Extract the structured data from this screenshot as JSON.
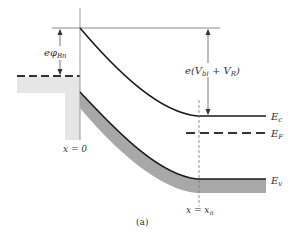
{
  "figure": {
    "caption": "(a)",
    "labels": {
      "barrier_height": "eφ",
      "barrier_height_sub": "Bn",
      "potential": "e(V",
      "potential_sub1": "bi",
      "potential_mid": " + V",
      "potential_sub2": "R",
      "potential_end": ")",
      "ec": "E",
      "ec_sub": "c",
      "ef": "E",
      "ef_sub": "F",
      "ev": "E",
      "ev_sub": "v",
      "x0": "x = 0",
      "xn": "x = x",
      "xn_sub": "n"
    },
    "colors": {
      "line": "#1a1a1a",
      "band_fill": "#a8a8a8",
      "metal_fill": "#e6e6e6",
      "thin_line": "#777777"
    }
  }
}
